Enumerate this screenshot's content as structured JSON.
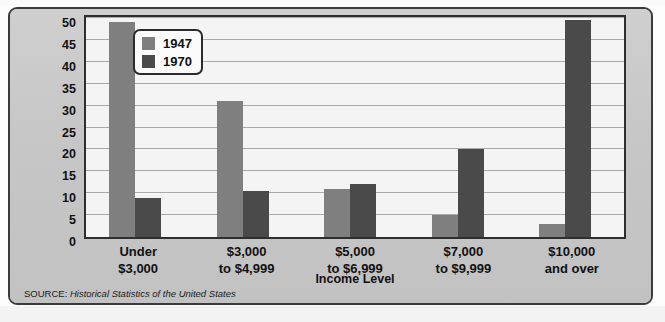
{
  "figure": {
    "title_partial": "",
    "source_prefix": "SOURCE:",
    "source_body": "Historical Statistics of the United States",
    "panel_bg": "#c9c9c9",
    "plot_bg": "#f4f4f4",
    "frame_color": "#2e2e2e"
  },
  "legend": {
    "position": "top-left-inside",
    "entries": [
      {
        "label": "1947",
        "color": "#7f7f7f"
      },
      {
        "label": "1970",
        "color": "#4a4a4a"
      }
    ]
  },
  "axis": {
    "y_title": "Percentage of families",
    "x_title": "Income Level",
    "y_ticks": [
      "50",
      "45",
      "40",
      "35",
      "30",
      "25",
      "20",
      "15",
      "10",
      "5",
      "0"
    ]
  },
  "categories_wrapped": [
    {
      "line1": "Under",
      "line2": "$3,000"
    },
    {
      "line1": "$3,000",
      "line2": "to $4,999"
    },
    {
      "line1": "$5,000",
      "line2": "to $6,999"
    },
    {
      "line1": "$7,000",
      "line2": "to $9,999"
    },
    {
      "line1": "$10,000",
      "line2": "and over"
    }
  ],
  "chart_data": {
    "type": "bar",
    "title": "",
    "xlabel": "Income Level",
    "ylabel": "Percentage of families",
    "categories": [
      "Under $3,000",
      "$3,000 to $4,999",
      "$5,000 to $6,999",
      "$7,000 to $9,999",
      "$10,000 and over"
    ],
    "series": [
      {
        "name": "1947",
        "color": "#7f7f7f",
        "values": [
          49,
          31,
          11,
          5,
          3
        ]
      },
      {
        "name": "1970",
        "color": "#4a4a4a",
        "values": [
          9,
          10.5,
          12,
          20,
          49.5
        ]
      }
    ],
    "ylim": [
      0,
      50
    ],
    "ytick_step": 5,
    "grid": true,
    "legend_position": "top-left inside plot",
    "source": "SOURCE: Historical Statistics of the United States"
  }
}
